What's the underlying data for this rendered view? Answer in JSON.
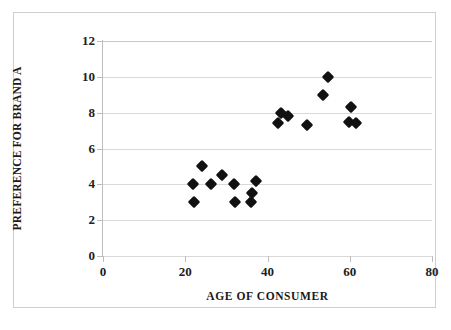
{
  "chart_data": {
    "type": "scatter",
    "title": "",
    "xlabel": "AGE OF CONSUMER",
    "ylabel": "PREFERENCE FOR BRAND A",
    "xlim": [
      0,
      80
    ],
    "ylim": [
      0,
      12
    ],
    "xticks": [
      0,
      20,
      40,
      60,
      80
    ],
    "yticks": [
      0,
      2,
      4,
      6,
      8,
      10,
      12
    ],
    "xtick_labels": [
      "0",
      "20",
      "40",
      "60",
      "80"
    ],
    "ytick_labels": [
      "0",
      "2",
      "4",
      "6",
      "8",
      "10",
      "12"
    ],
    "grid": "horizontal",
    "legend": null,
    "marker": "diamond",
    "marker_color": "#111111",
    "points": [
      {
        "x": 21.8,
        "y": 4.0
      },
      {
        "x": 22.1,
        "y": 3.0
      },
      {
        "x": 24.0,
        "y": 5.0
      },
      {
        "x": 26.2,
        "y": 4.0
      },
      {
        "x": 28.9,
        "y": 4.5
      },
      {
        "x": 31.8,
        "y": 4.0
      },
      {
        "x": 32.0,
        "y": 3.0
      },
      {
        "x": 35.9,
        "y": 3.0
      },
      {
        "x": 36.2,
        "y": 3.5
      },
      {
        "x": 37.1,
        "y": 4.2
      },
      {
        "x": 42.5,
        "y": 7.4
      },
      {
        "x": 43.4,
        "y": 8.0
      },
      {
        "x": 45.1,
        "y": 7.8
      },
      {
        "x": 49.5,
        "y": 7.3
      },
      {
        "x": 53.6,
        "y": 9.0
      },
      {
        "x": 54.6,
        "y": 10.0
      },
      {
        "x": 59.7,
        "y": 7.5
      },
      {
        "x": 60.4,
        "y": 8.3
      },
      {
        "x": 61.4,
        "y": 7.4
      }
    ]
  }
}
